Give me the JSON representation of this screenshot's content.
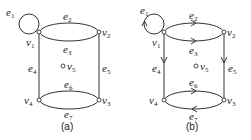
{
  "figures": [
    {
      "id": "a",
      "caption": "(a)",
      "directed": false,
      "vertices": [
        {
          "name": "v",
          "sub": "1"
        },
        {
          "name": "v",
          "sub": "2"
        },
        {
          "name": "v",
          "sub": "3"
        },
        {
          "name": "v",
          "sub": "4"
        },
        {
          "name": "v",
          "sub": "5"
        }
      ],
      "edges": [
        {
          "name": "e",
          "sub": "1",
          "from": "v1",
          "to": "v1",
          "kind": "loop"
        },
        {
          "name": "e",
          "sub": "2",
          "from": "v1",
          "to": "v2"
        },
        {
          "name": "e",
          "sub": "3",
          "from": "v1",
          "to": "v2"
        },
        {
          "name": "e",
          "sub": "4",
          "from": "v1",
          "to": "v4"
        },
        {
          "name": "e",
          "sub": "5",
          "from": "v2",
          "to": "v3"
        },
        {
          "name": "e",
          "sub": "6",
          "from": "v4",
          "to": "v3"
        },
        {
          "name": "e",
          "sub": "7",
          "from": "v4",
          "to": "v3"
        }
      ]
    },
    {
      "id": "b",
      "caption": "(b)",
      "directed": true,
      "vertices": [
        {
          "name": "v",
          "sub": "1"
        },
        {
          "name": "v",
          "sub": "2"
        },
        {
          "name": "v",
          "sub": "3"
        },
        {
          "name": "v",
          "sub": "4"
        },
        {
          "name": "v",
          "sub": "5"
        }
      ],
      "edges": [
        {
          "name": "e",
          "sub": "1",
          "from": "v1",
          "to": "v1",
          "kind": "loop"
        },
        {
          "name": "e",
          "sub": "2",
          "from": "v1",
          "to": "v2"
        },
        {
          "name": "e",
          "sub": "3",
          "from": "v1",
          "to": "v2"
        },
        {
          "name": "e",
          "sub": "4",
          "from": "v1",
          "to": "v4"
        },
        {
          "name": "e",
          "sub": "5",
          "from": "v2",
          "to": "v3"
        },
        {
          "name": "e",
          "sub": "6",
          "from": "v4",
          "to": "v3"
        },
        {
          "name": "e",
          "sub": "7",
          "from": "v3",
          "to": "v4"
        }
      ]
    }
  ]
}
